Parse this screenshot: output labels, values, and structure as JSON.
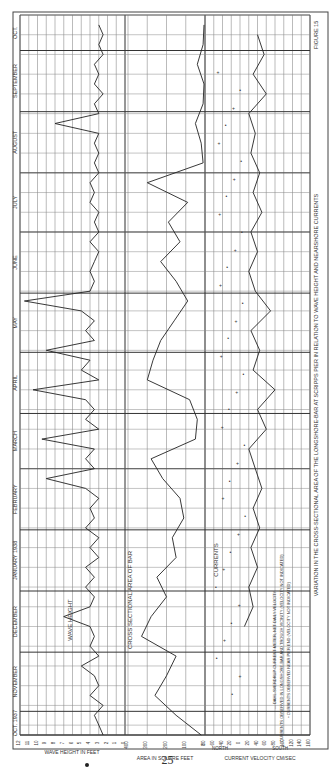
{
  "page": {
    "number": "25",
    "figure_label": "FIGURE 15",
    "caption": "VARIATION IN THE CROSS-SECTIONAL AREA OF THE LONGSHORE-BAR AT SCRIPPS PIER IN RELATION TO WAVE HEIGHT AND NEARSHORE CURRENTS"
  },
  "time_axis": {
    "months": [
      {
        "label": "OCT. 1937",
        "ticks": [
          "20"
        ]
      },
      {
        "label": "NOVEMBER",
        "ticks": [
          "10",
          "20"
        ]
      },
      {
        "label": "DECEMBER",
        "ticks": [
          "10",
          "20"
        ]
      },
      {
        "label": "JANUARY 1938",
        "ticks": [
          "10",
          "20"
        ]
      },
      {
        "label": "FEBRUARY",
        "ticks": [
          "10",
          "20"
        ]
      },
      {
        "label": "MARCH",
        "ticks": [
          "10",
          "20"
        ]
      },
      {
        "label": "APRIL",
        "ticks": [
          "10",
          "20"
        ]
      },
      {
        "label": "MAY",
        "ticks": [
          "10",
          "20"
        ]
      },
      {
        "label": "JUNE",
        "ticks": [
          "10",
          "20"
        ]
      },
      {
        "label": "JULY",
        "ticks": [
          "10",
          "20"
        ]
      },
      {
        "label": "AUGUST",
        "ticks": [
          "10",
          "20"
        ]
      },
      {
        "label": "SEPTEMBER",
        "ticks": [
          "10",
          "20"
        ]
      },
      {
        "label": "OCT.",
        "ticks": [
          "10"
        ]
      }
    ]
  },
  "panels": {
    "wave": {
      "title": "WAVE HEIGHT",
      "axis_label": "WAVE HEIGHT IN FEET",
      "ticks": [
        "12",
        "11",
        "10",
        "9",
        "8",
        "7",
        "6",
        "5",
        "4",
        "3",
        "2",
        "1",
        "0"
      ]
    },
    "area": {
      "title": "CROSS SECTIONAL AREA OF BAR",
      "axis_label": "AREA IN SQUARE FEET",
      "ticks": [
        "400",
        "300",
        "200",
        "100",
        "0"
      ]
    },
    "currents": {
      "title": "CURRENTS",
      "axis_label": "CURRENT VELOCITY CM/SEC",
      "north_label": "NORTH",
      "south_label": "SOUTH",
      "ticks": [
        "80",
        "60",
        "40",
        "20",
        "0",
        "20",
        "40",
        "60",
        "80",
        "100",
        "120",
        "140",
        "160"
      ],
      "legend": [
        "— DAHL-SVERDRUP CURRENT METER, NET DAILY VELOCITY",
        "+ CURRENTS OBSERVED IN LONGSHORE-BAR AND TROUGH VICINITY (VELOCITY NOT INDICATED)",
        "• CURRENTS OBSERVED NEAR PIER END (VELOCITY NOT INDICATED)"
      ]
    }
  },
  "chart_data": [
    {
      "type": "line",
      "title": "WAVE HEIGHT",
      "xlabel": "Date (Oct 1937 – Oct 1938)",
      "ylabel": "WAVE HEIGHT IN FEET",
      "ylim": [
        0,
        12
      ],
      "grid": true,
      "x_days": [
        0,
        5,
        10,
        15,
        20,
        25,
        30,
        35,
        40,
        45,
        50,
        55,
        60,
        65,
        70,
        75,
        80,
        85,
        90,
        95,
        100,
        105,
        110,
        115,
        120,
        125,
        130,
        135,
        140,
        145,
        150,
        155,
        160,
        165,
        170,
        175,
        180,
        185,
        190,
        195,
        200,
        205,
        210,
        215,
        220,
        225,
        230,
        235,
        240,
        245,
        250,
        255,
        260,
        265,
        270,
        275,
        280,
        285,
        290,
        295,
        300,
        305,
        310,
        315,
        320,
        325,
        330,
        335,
        340,
        345,
        350,
        355,
        360
      ],
      "values": [
        2.5,
        3,
        3.5,
        2.5,
        4,
        3,
        3.5,
        5,
        3,
        4,
        3.5,
        4,
        7,
        4,
        3.5,
        4.5,
        3.5,
        4.5,
        3,
        4,
        3,
        4.5,
        3.5,
        4,
        3,
        4.5,
        9,
        3.5,
        4.5,
        3.5,
        9.5,
        3,
        4.5,
        3.5,
        4.5,
        10.5,
        3,
        5,
        4,
        9,
        3.5,
        4.5,
        3.5,
        5,
        11.5,
        4,
        3.5,
        4,
        3.5,
        3,
        4,
        3,
        3.5,
        3,
        4,
        3.5,
        4,
        3,
        3.5,
        3,
        3.5,
        3,
        8,
        3,
        3.5,
        2.5,
        3.5,
        3,
        3.5,
        2.5,
        3,
        2.5,
        3
      ],
      "notes": "Values estimated visually from scanned plot; daily wave heights fluctuate mostly 2–5 ft with peaks up to ~11.5 ft (Feb–May 1938)."
    },
    {
      "type": "line",
      "title": "CROSS SECTIONAL AREA OF BAR",
      "xlabel": "Date (Oct 1937 – Oct 1938)",
      "ylabel": "AREA IN SQUARE FEET",
      "ylim": [
        0,
        400
      ],
      "grid": true,
      "x_days": [
        0,
        10,
        20,
        30,
        40,
        50,
        60,
        70,
        80,
        90,
        100,
        110,
        120,
        130,
        140,
        150,
        160,
        170,
        180,
        190,
        200,
        210,
        220,
        230,
        240,
        250,
        260,
        270,
        280,
        290,
        300,
        310,
        320,
        330,
        340,
        350,
        360
      ],
      "values": [
        20,
        150,
        260,
        200,
        150,
        330,
        280,
        200,
        250,
        150,
        170,
        110,
        130,
        220,
        280,
        50,
        40,
        80,
        300,
        270,
        230,
        160,
        90,
        150,
        230,
        130,
        190,
        90,
        300,
        10,
        20,
        50,
        10,
        5,
        40,
        10,
        5
      ],
      "notes": "Approximate; bar area high in winter/spring, near zero from late June through October 1938."
    },
    {
      "type": "line",
      "title": "CURRENTS",
      "xlabel": "Date (Oct 1937 – Oct 1938)",
      "ylabel": "CURRENT VELOCITY CM/SEC (negative = NORTH, positive = SOUTH)",
      "ylim": [
        -80,
        160
      ],
      "grid": true,
      "series": [
        {
          "name": "DAHL-SVERDRUP CURRENT METER, NET DAILY VELOCITY",
          "x_days": [
            55,
            65,
            75,
            85,
            95,
            105,
            115,
            125,
            135,
            145,
            155,
            165,
            175,
            185,
            195,
            205,
            215,
            225,
            235,
            245,
            255,
            265,
            275,
            285,
            295,
            305,
            315,
            325,
            335,
            345,
            355
          ],
          "values": [
            10,
            30,
            20,
            40,
            25,
            45,
            30,
            50,
            35,
            20,
            60,
            40,
            80,
            30,
            45,
            25,
            70,
            35,
            20,
            40,
            25,
            50,
            30,
            45,
            25,
            35,
            20,
            60,
            30,
            55,
            40
          ]
        }
      ],
      "markers": [
        {
          "name": "CURRENTS OBSERVED IN LONGSHORE-BAR AND TROUGH VICINITY",
          "symbol": "+"
        },
        {
          "name": "CURRENTS OBSERVED NEAR PIER END",
          "symbol": "•"
        }
      ],
      "notes": "Approximate values read from scanned figure."
    }
  ]
}
